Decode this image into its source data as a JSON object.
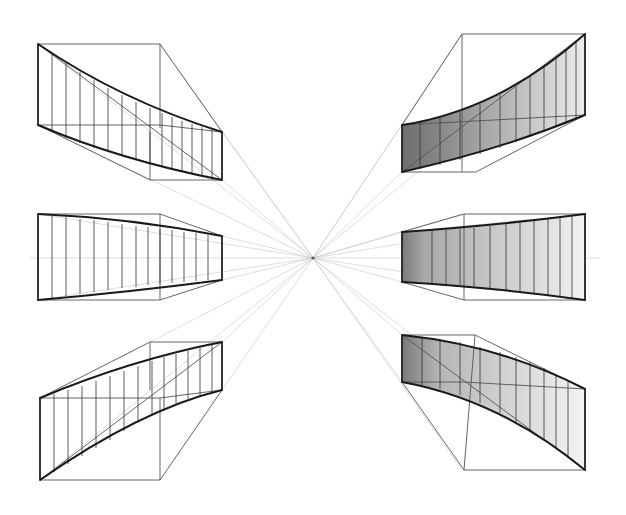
{
  "figure": {
    "title": "",
    "type": "one-point perspective sketch of curved ribbon panels",
    "vanishing_point": {
      "x": 313,
      "y": 258
    },
    "horizon_y": 258,
    "colors": {
      "background": "#ffffff",
      "ink": "#1a1a1a",
      "construction": "#c8c8c8",
      "shade_dark": "#6e6e6e",
      "shade_light": "#ececec"
    },
    "panels": [
      {
        "id": "top-left",
        "shaded": false,
        "curve": "sag-down"
      },
      {
        "id": "middle-left",
        "shaded": false,
        "curve": "straight-taper"
      },
      {
        "id": "bottom-left",
        "shaded": false,
        "curve": "arch-up"
      },
      {
        "id": "top-right",
        "shaded": true,
        "curve": "arch-up"
      },
      {
        "id": "middle-right",
        "shaded": true,
        "curve": "straight-taper"
      },
      {
        "id": "bottom-right",
        "shaded": true,
        "curve": "sag-down"
      }
    ]
  }
}
